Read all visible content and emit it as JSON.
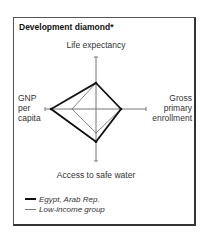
{
  "chart_data": {
    "type": "radar",
    "title": "Development diamond*",
    "axes": [
      {
        "key": "top",
        "label": [
          "Life expectancy"
        ]
      },
      {
        "key": "right",
        "label": [
          "Gross",
          "primary",
          "enrollment"
        ]
      },
      {
        "key": "bottom",
        "label": [
          "Access to safe water"
        ]
      },
      {
        "key": "left",
        "label": [
          "GNP",
          "per",
          "capita"
        ]
      }
    ],
    "axis_order": [
      "Life expectancy",
      "Gross primary enrollment",
      "Access to safe water",
      "GNP per capita"
    ],
    "range": [
      0,
      1
    ],
    "series": [
      {
        "name": "Egypt, Arab Rep.",
        "values": [
          0.5,
          0.5,
          0.63,
          0.88
        ],
        "color": "#111111",
        "style": "thick"
      },
      {
        "name": "Low-income group",
        "values": [
          0.5,
          0.5,
          0.46,
          0.47
        ],
        "color": "#777777",
        "style": "thin"
      }
    ],
    "legend_position": "bottom-left"
  },
  "labels": {
    "top": "Life expectancy",
    "bottom": "Access to safe water",
    "left": [
      "GNP",
      "per",
      "capita"
    ],
    "right": [
      "Gross",
      "primary",
      "enrollment"
    ]
  },
  "legend": [
    {
      "label": "Egypt, Arab Rep."
    },
    {
      "label": "Low-income group"
    }
  ]
}
